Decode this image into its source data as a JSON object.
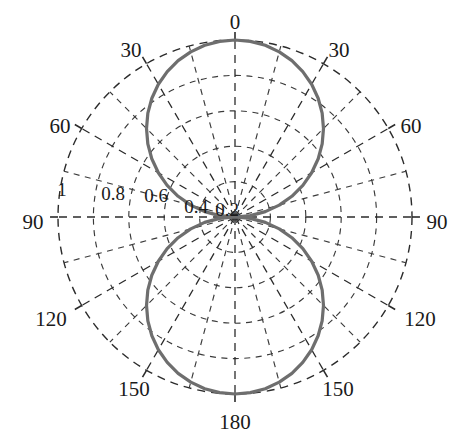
{
  "figure": {
    "background_color": "#ffffff",
    "curve_color": "#6e6e6e",
    "grid_color": "#3a3a3a",
    "text_color": "#1a1a1a"
  },
  "chart_data": {
    "type": "line",
    "subtype": "polar",
    "title": "",
    "subtitle": "",
    "xlabel": "",
    "ylabel": "",
    "grid": true,
    "legend": null,
    "angle_unit": "degrees",
    "angle_zero_at": "top",
    "angle_labels_mirrored": true,
    "angular_tick_labels": [
      "0",
      "30",
      "30",
      "60",
      "60",
      "90",
      "90",
      "120",
      "120",
      "150",
      "150",
      "180"
    ],
    "angular_ticks_deg": [
      0,
      30,
      330,
      60,
      300,
      90,
      270,
      120,
      240,
      150,
      210,
      180
    ],
    "angular_minor_step_deg": 15,
    "radial_tick_labels": [
      "1",
      "0.8",
      "0.6",
      "0.4",
      "0.2"
    ],
    "radial_ticks": [
      1.0,
      0.8,
      0.6,
      0.4,
      0.2
    ],
    "rlim": [
      0,
      1
    ],
    "radial_label_angle_deg": 300,
    "series": [
      {
        "name": "pattern",
        "expression": "|cos(theta)|",
        "theta_deg": [
          0,
          5,
          10,
          15,
          20,
          25,
          30,
          35,
          40,
          45,
          50,
          55,
          60,
          65,
          70,
          75,
          80,
          85,
          90,
          95,
          100,
          105,
          110,
          115,
          120,
          125,
          130,
          135,
          140,
          145,
          150,
          155,
          160,
          165,
          170,
          175,
          180,
          185,
          190,
          195,
          200,
          205,
          210,
          215,
          220,
          225,
          230,
          235,
          240,
          245,
          250,
          255,
          260,
          265,
          270,
          275,
          280,
          285,
          290,
          295,
          300,
          305,
          310,
          315,
          320,
          325,
          330,
          335,
          340,
          345,
          350,
          355,
          360
        ],
        "r": [
          1.0,
          0.996,
          0.985,
          0.966,
          0.94,
          0.906,
          0.866,
          0.819,
          0.766,
          0.707,
          0.643,
          0.574,
          0.5,
          0.423,
          0.342,
          0.259,
          0.174,
          0.087,
          0.0,
          0.087,
          0.174,
          0.259,
          0.342,
          0.423,
          0.5,
          0.574,
          0.643,
          0.707,
          0.766,
          0.819,
          0.866,
          0.906,
          0.94,
          0.966,
          0.985,
          0.996,
          1.0,
          0.996,
          0.985,
          0.966,
          0.94,
          0.906,
          0.866,
          0.819,
          0.766,
          0.707,
          0.643,
          0.574,
          0.5,
          0.423,
          0.342,
          0.259,
          0.174,
          0.087,
          0.0,
          0.087,
          0.174,
          0.259,
          0.342,
          0.423,
          0.5,
          0.574,
          0.643,
          0.707,
          0.766,
          0.819,
          0.866,
          0.906,
          0.94,
          0.966,
          0.985,
          0.996,
          1.0
        ]
      }
    ]
  },
  "labels": {
    "angles": [
      {
        "id": "angle-0",
        "text": "0",
        "x": 235,
        "y": 24
      },
      {
        "id": "angle-30-left",
        "text": "30",
        "x": 131,
        "y": 52
      },
      {
        "id": "angle-30-right",
        "text": "30",
        "x": 339,
        "y": 52
      },
      {
        "id": "angle-60-left",
        "text": "60",
        "x": 60,
        "y": 128
      },
      {
        "id": "angle-60-right",
        "text": "60",
        "x": 411,
        "y": 128
      },
      {
        "id": "angle-90-left",
        "text": "90",
        "x": 33,
        "y": 224
      },
      {
        "id": "angle-90-right",
        "text": "90",
        "x": 437,
        "y": 224
      },
      {
        "id": "angle-120-left",
        "text": "120",
        "x": 51,
        "y": 321
      },
      {
        "id": "angle-120-right",
        "text": "120",
        "x": 420,
        "y": 321
      },
      {
        "id": "angle-150-left",
        "text": "150",
        "x": 134,
        "y": 391
      },
      {
        "id": "angle-150-right",
        "text": "150",
        "x": 338,
        "y": 391
      },
      {
        "id": "angle-180",
        "text": "180",
        "x": 235,
        "y": 424
      }
    ],
    "radii": [
      {
        "id": "radius-1",
        "text": "1",
        "x": 62,
        "y": 192
      },
      {
        "id": "radius-0.8",
        "text": "0.8",
        "x": 113,
        "y": 196
      },
      {
        "id": "radius-0.6",
        "text": "0.6",
        "x": 156,
        "y": 198
      },
      {
        "id": "radius-0.4",
        "text": "0.4",
        "x": 196,
        "y": 209
      },
      {
        "id": "radius-0.2",
        "text": "0.2",
        "x": 227,
        "y": 212
      }
    ]
  },
  "geometry": {
    "center_x": 235,
    "center_y": 217,
    "outer_radius": 177,
    "ring_count": 5
  }
}
